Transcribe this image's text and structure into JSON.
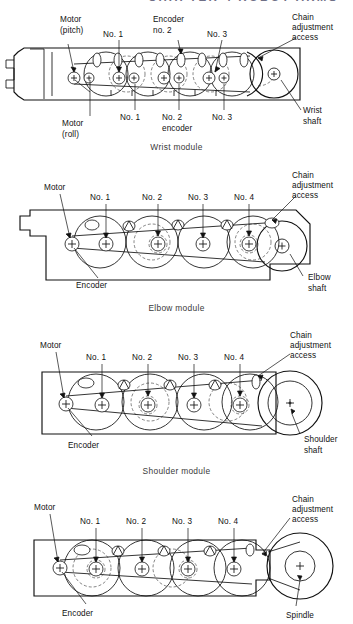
{
  "page": {
    "running_head": "CHAPTER 4   ROBOT ARMS",
    "background_color": "#ffffff",
    "line_color": "#111111"
  },
  "figures": [
    {
      "id": "wrist-module",
      "caption": "Wrist module",
      "labels_top": [
        "Motor",
        "(pitch)",
        "No. 1",
        "Encoder",
        "no. 2",
        "No. 3",
        "Chain",
        "adjustment",
        "access"
      ],
      "labels_bottom": [
        "Motor",
        "(roll)",
        "No. 1",
        "No. 2",
        "encoder",
        "No. 3",
        "Wrist",
        "shaft"
      ],
      "callouts": {
        "motor_pitch": "Motor",
        "motor_pitch_sub": "(pitch)",
        "motor_roll": "Motor",
        "motor_roll_sub": "(roll)",
        "no1_top": "No. 1",
        "no1_bottom": "No. 1",
        "encoder2_top": "Encoder",
        "encoder2_top_sub": "no. 2",
        "encoder2_bottom": "No. 2",
        "encoder2_bottom_sub": "encoder",
        "no3_top": "No. 3",
        "no3_bottom": "No. 3",
        "chain1": "Chain",
        "chain2": "adjustment",
        "chain3": "access",
        "shaft1": "Wrist",
        "shaft2": "shaft"
      }
    },
    {
      "id": "elbow-module",
      "caption": "Elbow module",
      "callouts": {
        "motor": "Motor",
        "encoder": "Encoder",
        "no1": "No. 1",
        "no2": "No. 2",
        "no3": "No. 3",
        "no4": "No. 4",
        "chain1": "Chain",
        "chain2": "adjustment",
        "chain3": "access",
        "shaft1": "Elbow",
        "shaft2": "shaft"
      }
    },
    {
      "id": "shoulder-module",
      "caption": "Shoulder module",
      "callouts": {
        "motor": "Motor",
        "encoder": "Encoder",
        "no1": "No. 1",
        "no2": "No. 2",
        "no3": "No. 3",
        "no4": "No. 4",
        "chain1": "Chain",
        "chain2": "adjustment",
        "chain3": "access",
        "shaft1": "Shoulder",
        "shaft2": "shaft"
      }
    },
    {
      "id": "spindle-module",
      "caption": "",
      "callouts": {
        "motor": "Motor",
        "encoder": "Encoder",
        "no1": "No. 1",
        "no2": "No. 2",
        "no3": "No. 3",
        "no4": "No. 4",
        "chain1": "Chain",
        "chain2": "adjustment",
        "chain3": "access",
        "shaft1": "Spindle"
      }
    }
  ]
}
